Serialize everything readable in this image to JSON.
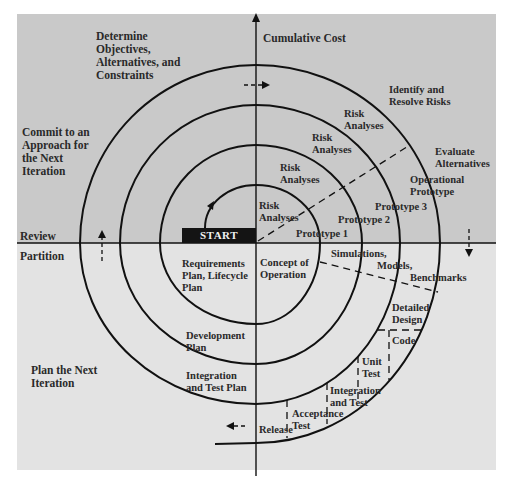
{
  "colors": {
    "upper_background": "#c9c9c9",
    "lower_background": "#e3e3e3",
    "line": "#111111",
    "text": "#2a2a2a",
    "start_box": "#141414",
    "start_text": "#f0f0f0"
  },
  "axes": {
    "vertical_label": "Cumulative Cost",
    "left_upper_label": "Review",
    "left_lower_label": "Partition"
  },
  "quadrants": {
    "top_left": "Determine\nObjectives,\nAlternatives, and\nConstraints",
    "top_right": "Identify and\nResolve Risks",
    "right": "Evaluate\nAlternatives",
    "left": "Commit to an\nApproach for\nthe Next\nIteration",
    "bottom_left": "Plan the Next\nIteration"
  },
  "start_label": "START",
  "risk_analyses": [
    "Risk\nAnalyses",
    "Risk\nAnalyses",
    "Risk\nAnalyses",
    "Risk\nAnalyses"
  ],
  "prototypes": [
    "Prototype 1",
    "Prototype 2",
    "Prototype 3",
    "Operational\nPrototype"
  ],
  "plans": [
    "Requirements\nPlan, Lifecycle\nPlan",
    "Development\nPlan",
    "Integration\nand Test Plan"
  ],
  "concept": "Concept of\nOperation",
  "simulations": [
    "Simulations,",
    "Models,",
    "Benchmarks"
  ],
  "phases": {
    "detailed_design": "Detailed\nDesign",
    "code": "Code",
    "unit_test": "Unit\nTest",
    "integration_test": "Integration\nand Test",
    "acceptance_test": "Acceptance\nTest",
    "release": "Release"
  }
}
